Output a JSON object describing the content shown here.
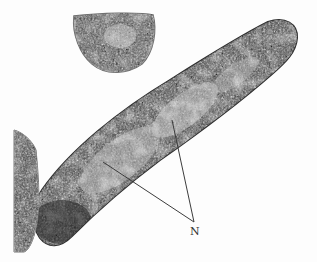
{
  "figure": {
    "kind": "transmission electron micrograph",
    "background_color": "#fdfdfd",
    "cell_dark_color": "#3a3a3a",
    "cell_light_color": "#cfcfcf"
  },
  "annotations": [
    {
      "label": "N",
      "meaning": "nucleoid regions",
      "label_position": {
        "x": 190,
        "y": 226
      },
      "leader_lines": [
        {
          "from": {
            "x": 194,
            "y": 222
          },
          "to": {
            "x": 103,
            "y": 162
          }
        },
        {
          "from": {
            "x": 194,
            "y": 222
          },
          "to": {
            "x": 172,
            "y": 120
          }
        }
      ]
    }
  ]
}
